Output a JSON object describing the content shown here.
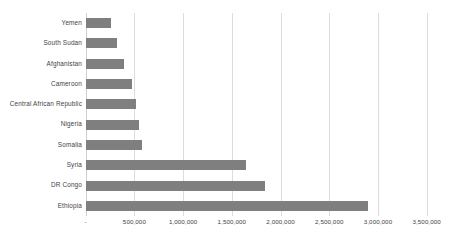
{
  "chart_data": {
    "type": "bar",
    "orientation": "horizontal",
    "title": "",
    "subtitle": "",
    "xlabel": "",
    "ylabel": "",
    "categories": [
      "Yemen",
      "South Sudan",
      "Afghanistan",
      "Cameroon",
      "Central African Republic",
      "Nigeria",
      "Somalia",
      "Syria",
      "DR Congo",
      "Ethiopia"
    ],
    "values": [
      257000,
      325000,
      397000,
      479000,
      516000,
      550000,
      575000,
      1650000,
      1840000,
      2900000
    ],
    "series": [
      {
        "name": "",
        "values": [
          257000,
          325000,
          397000,
          479000,
          516000,
          550000,
          575000,
          1650000,
          1840000,
          2900000
        ]
      }
    ],
    "xlim": [
      0,
      3500000
    ],
    "xticks": [
      0,
      500000,
      1000000,
      1500000,
      2000000,
      2500000,
      3000000,
      3500000
    ],
    "xtick_labels": [
      "-",
      "500,000",
      "1,000,000",
      "1,500,000",
      "2,000,000",
      "2,500,000",
      "3,000,000",
      "3,500,000"
    ],
    "grid": true,
    "grid_axis": "x",
    "legend": false,
    "legend_position": "none",
    "bar_color": "#7f7f7f",
    "gridline_color": "#dcdcdc",
    "label_color": "#3f3f3f",
    "background_color": "#ffffff"
  }
}
